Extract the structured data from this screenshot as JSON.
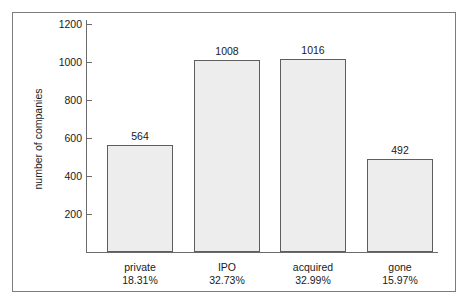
{
  "chart_data": {
    "type": "bar",
    "title": "",
    "subtitle": "",
    "xlabel": "",
    "ylabel": "number of companies",
    "categories": [
      "private",
      "IPO",
      "acquired",
      "gone"
    ],
    "values": [
      564,
      1008,
      1016,
      492
    ],
    "percent_labels": [
      "18.31%",
      "32.73%",
      "32.99%",
      "15.97%"
    ],
    "data_labels": [
      "564",
      "1008",
      "1016",
      "492"
    ],
    "ylim": [
      0,
      1290
    ],
    "yticks": [
      200,
      400,
      600,
      800,
      1000,
      1200
    ],
    "ytick_labels": [
      "200",
      "400",
      "600",
      "800",
      "1000",
      "1200"
    ],
    "grid": false,
    "legend": null,
    "legend_position": "none",
    "bar_fill_color": "#ededed",
    "bar_edge_color": "#5e5e5e",
    "axis_color": "#6b6b6b",
    "text_color": "#1a1a1a",
    "frame_color": "#7c7c7c",
    "background_color": "#ffffff"
  }
}
